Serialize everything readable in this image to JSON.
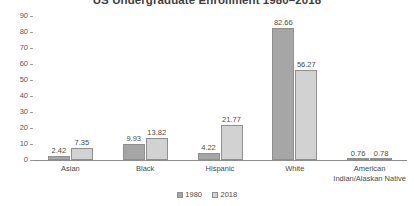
{
  "chart_data": {
    "type": "bar",
    "title": "US Undergraduate Enrollment 1980–2018",
    "xlabel": "",
    "ylabel": "",
    "ylim": [
      0,
      90
    ],
    "yticks": [
      90,
      80,
      70,
      60,
      50,
      40,
      30,
      20,
      10,
      0
    ],
    "grid": false,
    "legend_position": "bottom",
    "categories": [
      "Asian",
      "Black",
      "Hispanic",
      "White",
      "American\nIndian/Alaskan Native"
    ],
    "category_labels": [
      {
        "line1": "Asian",
        "line2": ""
      },
      {
        "line1": "Black",
        "line2": ""
      },
      {
        "line1": "Hispanic",
        "line2": ""
      },
      {
        "line1": "White",
        "line2": ""
      },
      {
        "line1": "American",
        "line2": "Indian/Alaskan Native"
      }
    ],
    "series": [
      {
        "name": "1980",
        "color": "#a6a6a6",
        "values": [
          2.42,
          9.93,
          4.22,
          82.66,
          0.76
        ],
        "labels": [
          "2.42",
          "9.93",
          "4.22",
          "82.66",
          "0.76"
        ]
      },
      {
        "name": "2018",
        "color": "#d2d2d2",
        "values": [
          7.35,
          13.82,
          21.77,
          56.27,
          0.78
        ],
        "labels": [
          "7.35",
          "13.82",
          "21.77",
          "56.27",
          "0.78"
        ]
      }
    ]
  },
  "colors": {
    "series_1980": "#a6a6a6",
    "series_2018": "#d2d2d2",
    "bar_border": "#8f8f8f",
    "axis": "#8c8c8c",
    "text": "#4a4a4a",
    "background": "#ffffff"
  }
}
